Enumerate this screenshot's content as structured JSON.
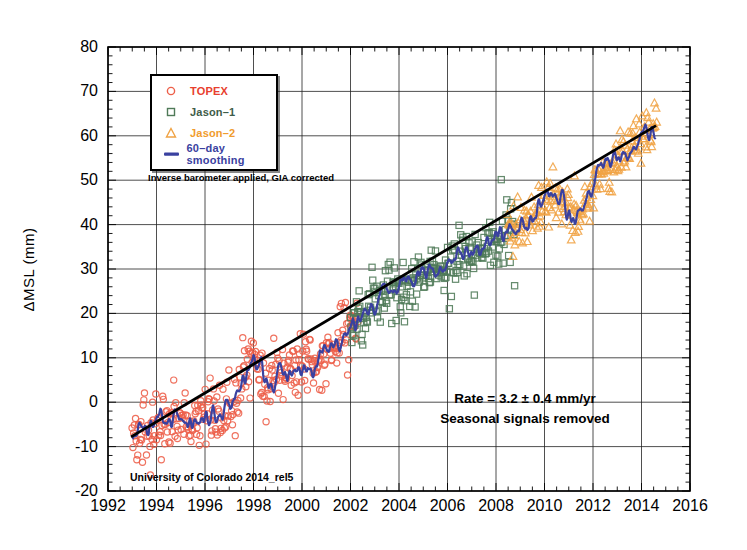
{
  "chart_data": {
    "type": "scatter",
    "title": "",
    "xlabel": "",
    "ylabel": "ΔMSL (mm)",
    "xlim": [
      1992,
      2016
    ],
    "ylim": [
      -20,
      80
    ],
    "x_ticks": [
      1992,
      1994,
      1996,
      1998,
      2000,
      2002,
      2004,
      2006,
      2008,
      2010,
      2012,
      2014,
      2016
    ],
    "y_ticks": [
      -20,
      -10,
      0,
      10,
      20,
      30,
      40,
      50,
      60,
      70,
      80
    ],
    "x_minor_step": 0.5,
    "y_minor_step": 2,
    "grid": true,
    "grid_color": "#222222",
    "legend_position": "top-left",
    "trend": {
      "rate_mm_per_yr": 3.2,
      "uncertainty_mm_per_yr": 0.4,
      "start": [
        1992.95,
        -7.8
      ],
      "end": [
        2014.6,
        62.3
      ],
      "color": "#000000"
    },
    "smoothed": {
      "name": "60–day smoothing",
      "color": "#3a41a0",
      "jitter_seed": 3,
      "jitter_amplitude_mm": 2.4,
      "points": [
        [
          1993.0,
          -7
        ],
        [
          1993.25,
          -5.5
        ],
        [
          1993.5,
          -6.5
        ],
        [
          1993.75,
          -5.5
        ],
        [
          1994.0,
          -5
        ],
        [
          1994.25,
          -4
        ],
        [
          1994.5,
          -5
        ],
        [
          1994.75,
          -5.5
        ],
        [
          1995.0,
          -3.5
        ],
        [
          1995.25,
          -4
        ],
        [
          1995.5,
          -5
        ],
        [
          1995.75,
          -4
        ],
        [
          1996.0,
          -2.5
        ],
        [
          1996.25,
          -2
        ],
        [
          1996.5,
          -3
        ],
        [
          1996.75,
          -2.5
        ],
        [
          1997.0,
          -1
        ],
        [
          1997.25,
          0.5
        ],
        [
          1997.5,
          3
        ],
        [
          1997.75,
          6.5
        ],
        [
          1998.0,
          9
        ],
        [
          1998.25,
          7.5
        ],
        [
          1998.5,
          4.5
        ],
        [
          1998.75,
          5
        ],
        [
          1999.0,
          5.5
        ],
        [
          1999.25,
          6.5
        ],
        [
          1999.5,
          6
        ],
        [
          1999.75,
          7.5
        ],
        [
          2000.0,
          8.5
        ],
        [
          2000.25,
          9.5
        ],
        [
          2000.5,
          8.5
        ],
        [
          2000.75,
          10
        ],
        [
          2001.0,
          12
        ],
        [
          2001.25,
          13
        ],
        [
          2001.5,
          13.5
        ],
        [
          2001.75,
          15
        ],
        [
          2002.0,
          16.5
        ],
        [
          2002.25,
          18
        ],
        [
          2002.5,
          19.5
        ],
        [
          2002.75,
          20.5
        ],
        [
          2003.0,
          22.5
        ],
        [
          2003.25,
          24
        ],
        [
          2003.5,
          25
        ],
        [
          2003.75,
          25.5
        ],
        [
          2004.0,
          26
        ],
        [
          2004.25,
          26.5
        ],
        [
          2004.5,
          27.5
        ],
        [
          2004.75,
          28
        ],
        [
          2005.0,
          29.5
        ],
        [
          2005.25,
          30
        ],
        [
          2005.5,
          29.5
        ],
        [
          2005.75,
          30.5
        ],
        [
          2006.0,
          31
        ],
        [
          2006.25,
          32
        ],
        [
          2006.5,
          33
        ],
        [
          2006.75,
          33.5
        ],
        [
          2007.0,
          34.5
        ],
        [
          2007.25,
          34
        ],
        [
          2007.5,
          35
        ],
        [
          2007.75,
          36
        ],
        [
          2008.0,
          36.5
        ],
        [
          2008.25,
          37.5
        ],
        [
          2008.5,
          38
        ],
        [
          2008.75,
          39
        ],
        [
          2009.0,
          40.5
        ],
        [
          2009.25,
          41.5
        ],
        [
          2009.5,
          43
        ],
        [
          2009.75,
          44.5
        ],
        [
          2010.0,
          46.5
        ],
        [
          2010.25,
          48
        ],
        [
          2010.5,
          46.5
        ],
        [
          2010.75,
          44.5
        ],
        [
          2011.0,
          42
        ],
        [
          2011.25,
          41.5
        ],
        [
          2011.5,
          43
        ],
        [
          2011.75,
          45
        ],
        [
          2012.0,
          48
        ],
        [
          2012.25,
          52
        ],
        [
          2012.5,
          54
        ],
        [
          2012.75,
          52.5
        ],
        [
          2013.0,
          55
        ],
        [
          2013.25,
          57.5
        ],
        [
          2013.5,
          56
        ],
        [
          2013.75,
          58
        ],
        [
          2014.0,
          60
        ],
        [
          2014.25,
          62
        ],
        [
          2014.45,
          60.5
        ],
        [
          2014.6,
          62
        ]
      ]
    },
    "series": [
      {
        "name": "TOPEX",
        "marker": "circle",
        "color": "#ed5f49",
        "label_color": "#e8402e",
        "t_start": 1993.0,
        "t_end": 2002.35,
        "n_points": 335,
        "sigma_mm": 3.4,
        "seed": 7
      },
      {
        "name": "Jason–1",
        "marker": "square",
        "color": "#4f7a58",
        "label_color": "#3e5c49",
        "t_start": 2002.0,
        "t_end": 2008.8,
        "n_points": 245,
        "sigma_mm": 3.0,
        "seed": 13
      },
      {
        "name": "Jason–2",
        "marker": "triangle",
        "color": "#f0a344",
        "label_color": "#f09c2e",
        "t_start": 2008.45,
        "t_end": 2014.65,
        "n_points": 222,
        "sigma_mm": 3.0,
        "seed": 21
      }
    ],
    "legend": [
      {
        "label": "TOPEX",
        "marker": "circle",
        "marker_color": "#ed5f49",
        "label_color": "#e8402e"
      },
      {
        "label": "Jason–1",
        "marker": "square",
        "marker_color": "#4f7a58",
        "label_color": "#3e5c49"
      },
      {
        "label": "Jason–2",
        "marker": "triangle",
        "marker_color": "#f0a344",
        "label_color": "#f09c2e"
      },
      {
        "label": "60–day smoothing",
        "marker": "line",
        "marker_color": "#3a41a0",
        "label_color": "#3a41a0"
      }
    ]
  },
  "annotations": {
    "note": "Inverse barometer applied, GIA corrected",
    "source": "University of Colorado 2014_rel5",
    "rate": "Rate = 3.2 ± 0.4 mm/yr",
    "rate2": "Seasonal signals removed"
  }
}
